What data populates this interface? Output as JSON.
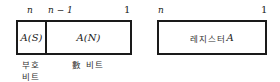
{
  "left_register": {
    "labels": {
      "msb": "n",
      "next": "n − 1",
      "lsb": "1"
    },
    "sign_field": "A(S)",
    "magnitude_field": "A(N)",
    "sign_caption_line1": "부호",
    "sign_caption_line2": "비트",
    "magnitude_caption": "數 비트"
  },
  "right_register": {
    "labels": {
      "msb": "n",
      "lsb": "1"
    },
    "field": "레지스터 ",
    "field_var": "A"
  },
  "colors": {
    "border": "#1a1a1a",
    "text": "#222222",
    "background": "#ffffff"
  }
}
